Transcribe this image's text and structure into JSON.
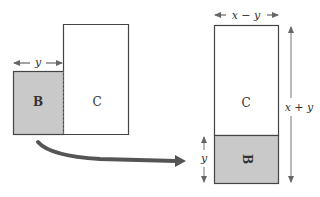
{
  "diagram": {
    "colors": {
      "stroke": "#444444",
      "shade_fill": "#c9c9c9",
      "arrow": "#555555",
      "background": "#ffffff"
    },
    "left_figure": {
      "region_b_label": "B",
      "region_c_label": "C",
      "width_label": "y"
    },
    "right_figure": {
      "region_c_label": "C",
      "region_b_label": "B",
      "top_width_label": "x − y",
      "height_label": "x + y",
      "b_height_label": "y"
    },
    "transform_arrow": {
      "meaning": "move B"
    }
  }
}
